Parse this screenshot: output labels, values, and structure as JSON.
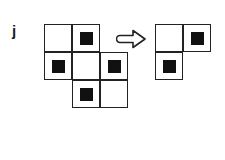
{
  "label": "j",
  "colors": {
    "line": "#222222",
    "fill": "#111111",
    "background": "#ffffff"
  },
  "left_grid": {
    "origin": [
      44,
      24
    ],
    "cell_size": 28,
    "cells": [
      {
        "row": 0,
        "col": 0,
        "filled": false
      },
      {
        "row": 0,
        "col": 1,
        "filled": true
      },
      {
        "row": 1,
        "col": 0,
        "filled": true
      },
      {
        "row": 1,
        "col": 1,
        "filled": false
      },
      {
        "row": 1,
        "col": 2,
        "filled": true
      },
      {
        "row": 2,
        "col": 1,
        "filled": true
      },
      {
        "row": 2,
        "col": 2,
        "filled": false
      }
    ]
  },
  "arrow": {
    "direction": "right",
    "style": "outline"
  },
  "right_grid": {
    "origin": [
      155,
      24
    ],
    "cell_size": 28,
    "cells": [
      {
        "row": 0,
        "col": 0,
        "filled": false
      },
      {
        "row": 0,
        "col": 1,
        "filled": true
      },
      {
        "row": 1,
        "col": 0,
        "filled": true
      }
    ]
  }
}
